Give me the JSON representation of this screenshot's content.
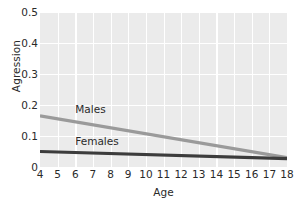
{
  "chart_data": {
    "type": "line",
    "title": "",
    "xlabel": "Age",
    "ylabel": "Agression",
    "xlim": [
      4,
      18
    ],
    "ylim": [
      0,
      0.5
    ],
    "grid": true,
    "legend_position": "inline-annotations",
    "x": [
      4,
      18
    ],
    "xticks": [
      "4",
      "5",
      "6",
      "7",
      "8",
      "9",
      "10",
      "11",
      "12",
      "13",
      "14",
      "15",
      "16",
      "17",
      "18"
    ],
    "yticks": [
      "0",
      "0.1",
      "0.2",
      "0.3",
      "0.4",
      "0.5"
    ],
    "ytick_values": [
      0,
      0.1,
      0.2,
      0.3,
      0.4,
      0.5
    ],
    "series": [
      {
        "name": "Males",
        "color": "#9a9a9a",
        "values": [
          0.165,
          0.03
        ],
        "label_x": 6.0,
        "label_y": 0.185
      },
      {
        "name": "Females",
        "color": "#3c3c3c",
        "values": [
          0.05,
          0.027
        ],
        "label_x": 6.0,
        "label_y": 0.082
      }
    ],
    "panel_color": "#ebebeb",
    "grid_color": "#ffffff"
  }
}
